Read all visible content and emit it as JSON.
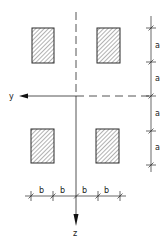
{
  "diagram": {
    "type": "cross-section layout",
    "axes": {
      "y_label": "y",
      "z_label": "z"
    },
    "dimensions": {
      "vertical_spacing_label": "a",
      "vertical_spacing_count": 4,
      "horizontal_spacing_label": "b",
      "horizontal_spacing_count": 4
    },
    "elements": [
      {
        "name": "top-left-section",
        "hatched": true
      },
      {
        "name": "top-right-section",
        "hatched": true
      },
      {
        "name": "bottom-left-section",
        "hatched": true
      },
      {
        "name": "bottom-right-section",
        "hatched": true
      }
    ],
    "labels": {
      "a1": "a",
      "a2": "a",
      "a3": "a",
      "a4": "a",
      "b1": "b",
      "b2": "b",
      "b3": "b",
      "b4": "b"
    },
    "colors": {
      "line": "#2a2a2a",
      "hatch": "#555555",
      "background": "#ffffff"
    }
  }
}
